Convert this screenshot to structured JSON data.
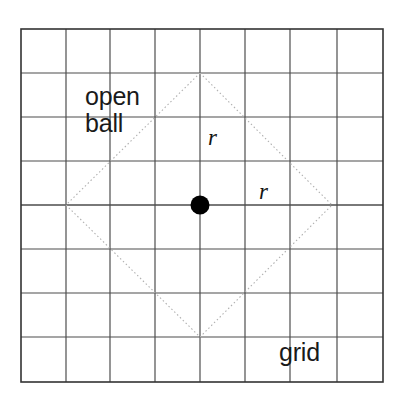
{
  "figure": {
    "background_color": "#ffffff",
    "labels": {
      "open_ball_line1": "open",
      "open_ball_line2": "ball",
      "grid": "grid",
      "radius_vertical": "r",
      "radius_horizontal": "r"
    },
    "colors": {
      "grid_line": "#4d4d4d",
      "grid_border": "#333333",
      "ball_outline": "#b0b0b0",
      "center_point": "#000000",
      "text": "#1a1a1a"
    },
    "grid": {
      "columns": 8,
      "rows": 8,
      "cell_size": 44,
      "origin_x": 21,
      "origin_y": 29,
      "width": 362,
      "height": 353,
      "x_lines": [
        21,
        66,
        110,
        155,
        200,
        245,
        290,
        337,
        383
      ],
      "y_lines": [
        29,
        73,
        117,
        161,
        205,
        249,
        293,
        337,
        382
      ],
      "line_width": 1.2,
      "border_width": 1.6
    },
    "center_point": {
      "x": 200,
      "y": 205,
      "radius": 9.5,
      "fill": "#000000"
    },
    "open_ball": {
      "shape": "diamond",
      "vertices": [
        {
          "name": "top",
          "x": 200,
          "y": 73
        },
        {
          "name": "right",
          "x": 332,
          "y": 205
        },
        {
          "name": "bottom",
          "x": 200,
          "y": 337
        },
        {
          "name": "left",
          "x": 66,
          "y": 205
        }
      ],
      "radius_cells": 3,
      "stroke": "#b0b0b0",
      "stroke_width": 1.1,
      "dash": "1.5 2.5",
      "fill": "none"
    }
  }
}
